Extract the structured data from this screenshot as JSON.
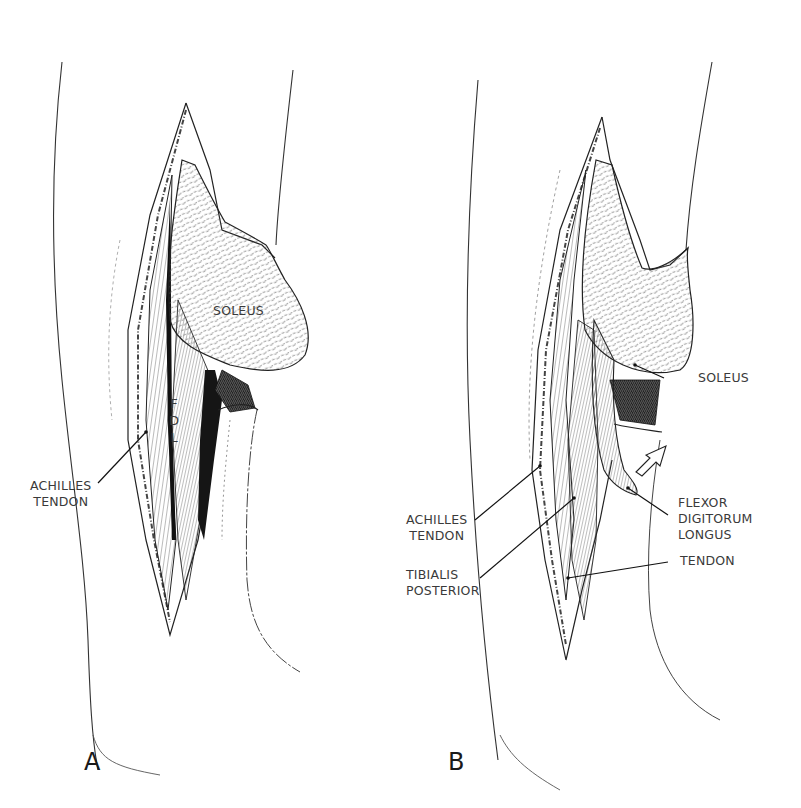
{
  "figure": {
    "panels": [
      {
        "id": "A",
        "letter": "A",
        "labels": {
          "soleus": "SOLEUS",
          "fdl": [
            "F",
            "D",
            "L"
          ],
          "achilles_tendon": "ACHILLES\nTENDON"
        }
      },
      {
        "id": "B",
        "letter": "B",
        "labels": {
          "soleus": "SOLEUS",
          "achilles_tendon": "ACHILLES\nTENDON",
          "tibialis_posterior": "TIBIALIS\nPOSTERIOR",
          "flexor_digitorum_longus": "FLEXOR\nDIGITORUM\nLONGUS",
          "tendon": "TENDON"
        },
        "arrow": "open-arrow-up-right"
      }
    ],
    "colors": {
      "ink": "#1a1a1a",
      "paper": "#ffffff",
      "hatch": "#555555"
    }
  }
}
